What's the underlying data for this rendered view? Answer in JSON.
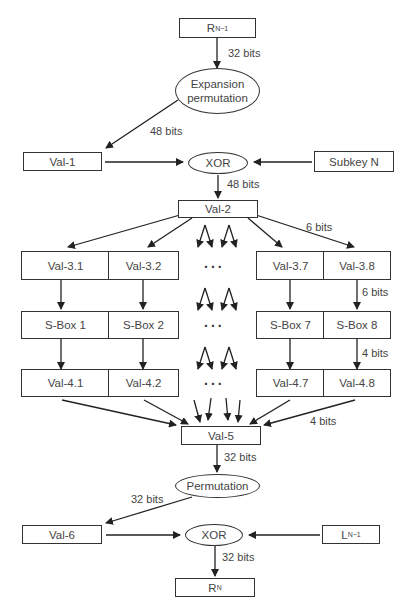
{
  "diagram": {
    "nodes": {
      "r_prev": {
        "main": "R",
        "sub": "N−1"
      },
      "expansion": "Expansion permutation",
      "val1": "Val-1",
      "xor1": "XOR",
      "subkey": "Subkey N",
      "val2": "Val-2",
      "val3": [
        "Val-3.1",
        "Val-3.2",
        "Val-3.7",
        "Val-3.8"
      ],
      "sbox": [
        "S-Box 1",
        "S-Box 2",
        "S-Box 7",
        "S-Box 8"
      ],
      "val4": [
        "Val-4.1",
        "Val-4.2",
        "Val-4.7",
        "Val-4.8"
      ],
      "val5": "Val-5",
      "permutation": "Permutation",
      "val6": "Val-6",
      "xor2": "XOR",
      "l_prev": {
        "main": "L",
        "sub": "N−1"
      },
      "r_next": {
        "main": "R",
        "sub": "N"
      }
    },
    "ellipsis": "...",
    "labels": {
      "r_to_exp": "32 bits",
      "exp_to_val1": "48 bits",
      "xor_to_val2": "48 bits",
      "val2_to_val3": "6 bits",
      "val3_to_sbox": "6 bits",
      "sbox_to_val4": "4 bits",
      "val4_to_val5": "4 bits",
      "val5_to_perm": "32 bits",
      "perm_to_val6": "32 bits",
      "xor_to_rn": "32 bits"
    }
  }
}
